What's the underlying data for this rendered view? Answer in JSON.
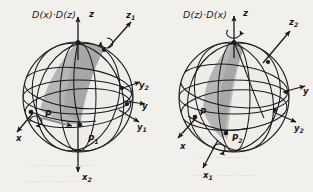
{
  "figure": {
    "background_color": "#f2f0ec",
    "ink_color": "#1a1a1a",
    "shade_color": "#a8a8a8",
    "sphere_fill": "#efedea"
  },
  "panels": [
    {
      "id": "left",
      "formula": "D(x)·D(z)",
      "sphere": {
        "cx": 78,
        "cy": 97,
        "r": 55
      },
      "axes": [
        {
          "name": "z",
          "base": "z",
          "sub": "",
          "label_x": 89,
          "label_y": 13,
          "rotation_arrow": false
        },
        {
          "name": "z1",
          "base": "z",
          "sub": "1",
          "label_x": 126,
          "label_y": 14,
          "rotation_arrow": true
        },
        {
          "name": "y2",
          "base": "y",
          "sub": "2",
          "label_x": 139,
          "label_y": 86,
          "rotation_arrow": false
        },
        {
          "name": "y",
          "base": "y",
          "sub": "",
          "label_x": 142,
          "label_y": 107,
          "rotation_arrow": false
        },
        {
          "name": "y1",
          "base": "y",
          "sub": "1",
          "label_x": 137,
          "label_y": 128,
          "rotation_arrow": false
        },
        {
          "name": "x",
          "base": "x",
          "sub": "",
          "label_x": 16,
          "label_y": 139,
          "rotation_arrow": true
        },
        {
          "name": "x2",
          "base": "x",
          "sub": "2",
          "label_x": 82,
          "label_y": 178,
          "rotation_arrow": false
        }
      ],
      "points": [
        {
          "name": "P",
          "base": "P",
          "sub": "",
          "label_x": 45,
          "label_y": 115
        },
        {
          "name": "P1",
          "base": "P",
          "sub": "1",
          "label_x": 88,
          "label_y": 140
        }
      ]
    },
    {
      "id": "right",
      "formula": "D(z)·D(x)",
      "sphere": {
        "cx": 234,
        "cy": 97,
        "r": 55
      },
      "axes": [
        {
          "name": "z",
          "base": "z",
          "sub": "",
          "label_x": 243,
          "label_y": 13,
          "rotation_arrow": true
        },
        {
          "name": "z2",
          "base": "z",
          "sub": "2",
          "label_x": 289,
          "label_y": 22,
          "rotation_arrow": false
        },
        {
          "name": "y",
          "base": "y",
          "sub": "",
          "label_x": 303,
          "label_y": 92,
          "rotation_arrow": false
        },
        {
          "name": "y2",
          "base": "y",
          "sub": "2",
          "label_x": 294,
          "label_y": 129,
          "rotation_arrow": false
        },
        {
          "name": "x",
          "base": "x",
          "sub": "",
          "label_x": 180,
          "label_y": 147,
          "rotation_arrow": false
        },
        {
          "name": "x1",
          "base": "x",
          "sub": "1",
          "label_x": 203,
          "label_y": 176,
          "rotation_arrow": true
        }
      ],
      "points": [
        {
          "name": "P",
          "base": "P",
          "sub": "",
          "label_x": 200,
          "label_y": 113
        },
        {
          "name": "P2",
          "base": "P",
          "sub": "2",
          "label_x": 232,
          "label_y": 139
        }
      ]
    }
  ],
  "bleed_through": {
    "line_a": "—— ——— ——",
    "line_b": "——— —— —",
    "line_c": "—— ————",
    "line_d": "——— —— ——"
  }
}
